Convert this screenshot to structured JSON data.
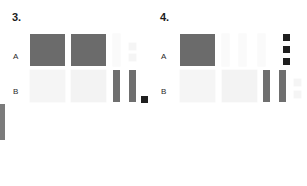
{
  "canvas": {
    "width": 307,
    "height": 186,
    "background": "#ffffff"
  },
  "colors": {
    "dark_gray": "#6f6f6f",
    "dark_gray_alt": "#6b6b6b",
    "near_black": "#1f1f1f",
    "pale": "#f5f5f5",
    "pale_alt": "#f3f3f3",
    "palest": "#fafafa",
    "edge_bar": "#7b7b7b",
    "label_text": "#1c1c1c",
    "row_text": "#2a2a2a"
  },
  "edge_artifact": {
    "name": "left-edge-bar",
    "x": 0,
    "y": 104,
    "w": 5,
    "h": 36,
    "tone": "tone-edge"
  },
  "panels": [
    {
      "id": "panel-3",
      "label": "3.",
      "label_x": 12,
      "label_y": 11,
      "rows": [
        {
          "id": "row-a",
          "label": "A",
          "label_x": 13,
          "label_y": 52,
          "cells": [
            {
              "name": "large-tile",
              "x": 30,
              "y": 34,
              "w": 35,
              "h": 32,
              "tone": "tone-dark2"
            },
            {
              "name": "large-tile",
              "x": 71,
              "y": 34,
              "w": 35,
              "h": 32,
              "tone": "tone-dark2"
            },
            {
              "name": "thin-bar",
              "x": 113,
              "y": 34,
              "w": 7,
              "h": 32,
              "tone": "tone-paler"
            },
            {
              "name": "small-tile",
              "x": 129,
              "y": 43,
              "w": 7,
              "h": 7,
              "tone": "tone-pale"
            },
            {
              "name": "small-tile",
              "x": 129,
              "y": 54,
              "w": 7,
              "h": 7,
              "tone": "tone-pale"
            }
          ]
        },
        {
          "id": "row-b",
          "label": "B",
          "label_x": 13,
          "label_y": 87,
          "cells": [
            {
              "name": "large-tile",
              "x": 30,
              "y": 70,
              "w": 35,
              "h": 32,
              "tone": "tone-pale"
            },
            {
              "name": "large-tile",
              "x": 71,
              "y": 70,
              "w": 35,
              "h": 32,
              "tone": "tone-pale2"
            },
            {
              "name": "thin-bar",
              "x": 113,
              "y": 70,
              "w": 7,
              "h": 32,
              "tone": "tone-dark"
            },
            {
              "name": "thin-bar",
              "x": 129,
              "y": 70,
              "w": 7,
              "h": 32,
              "tone": "tone-dark"
            },
            {
              "name": "dot-tile",
              "x": 141,
              "y": 96,
              "w": 7,
              "h": 7,
              "tone": "tone-black"
            }
          ]
        }
      ]
    },
    {
      "id": "panel-4",
      "label": "4.",
      "label_x": 160,
      "label_y": 11,
      "rows": [
        {
          "id": "row-a",
          "label": "A",
          "label_x": 161,
          "label_y": 52,
          "cells": [
            {
              "name": "large-tile",
              "x": 180,
              "y": 34,
              "w": 35,
              "h": 32,
              "tone": "tone-dark2"
            },
            {
              "name": "thin-bar",
              "x": 222,
              "y": 34,
              "w": 7,
              "h": 32,
              "tone": "tone-paler"
            },
            {
              "name": "thin-bar",
              "x": 239,
              "y": 34,
              "w": 7,
              "h": 32,
              "tone": "tone-paler"
            },
            {
              "name": "thin-bar",
              "x": 258,
              "y": 34,
              "w": 7,
              "h": 32,
              "tone": "tone-paler"
            },
            {
              "name": "dot-tile",
              "x": 283,
              "y": 34,
              "w": 7,
              "h": 7,
              "tone": "tone-black"
            },
            {
              "name": "dot-tile",
              "x": 283,
              "y": 46,
              "w": 7,
              "h": 7,
              "tone": "tone-black"
            },
            {
              "name": "dot-tile",
              "x": 283,
              "y": 58,
              "w": 7,
              "h": 7,
              "tone": "tone-black"
            }
          ]
        },
        {
          "id": "row-b",
          "label": "B",
          "label_x": 161,
          "label_y": 87,
          "cells": [
            {
              "name": "large-tile",
              "x": 180,
              "y": 70,
              "w": 35,
              "h": 32,
              "tone": "tone-pale"
            },
            {
              "name": "large-tile",
              "x": 222,
              "y": 70,
              "w": 35,
              "h": 32,
              "tone": "tone-pale2"
            },
            {
              "name": "thin-bar",
              "x": 263,
              "y": 70,
              "w": 7,
              "h": 32,
              "tone": "tone-dark"
            },
            {
              "name": "thin-bar",
              "x": 279,
              "y": 70,
              "w": 7,
              "h": 32,
              "tone": "tone-dark"
            },
            {
              "name": "small-tile",
              "x": 294,
              "y": 79,
              "w": 7,
              "h": 7,
              "tone": "tone-pale"
            },
            {
              "name": "small-tile",
              "x": 294,
              "y": 91,
              "w": 7,
              "h": 7,
              "tone": "tone-pale"
            }
          ]
        }
      ]
    }
  ]
}
